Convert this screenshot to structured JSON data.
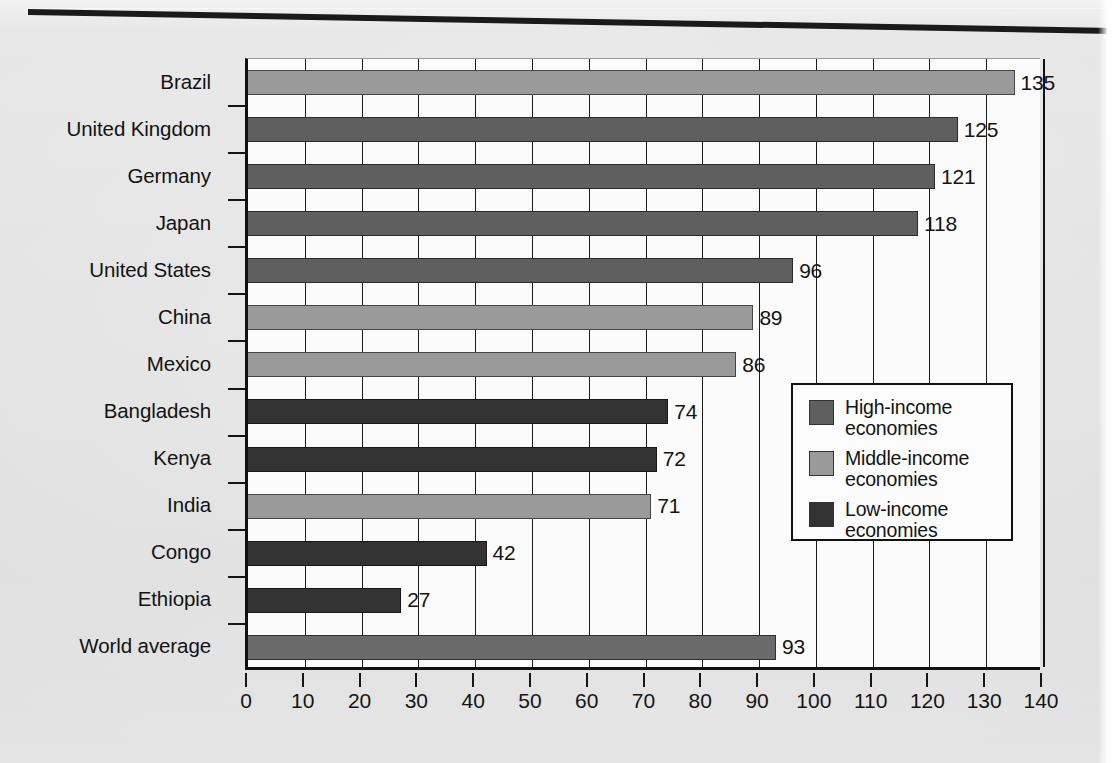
{
  "colors": {
    "high_income": "#5f5f5f",
    "middle_income": "#9a9a9a",
    "low_income": "#333333",
    "world_average": "#6a6a6a",
    "plot_background": "#fbfbfb",
    "axis": "#111111",
    "page_background": "#e1e1e1"
  },
  "legend": {
    "title": "",
    "position": "inside-right-middle",
    "items": [
      {
        "label": "High-income\neconomies",
        "color": "#5f5f5f",
        "key": "high_income"
      },
      {
        "label": "Middle-income\neconomies",
        "color": "#9a9a9a",
        "key": "middle_income"
      },
      {
        "label": "Low-income\neconomies",
        "color": "#333333",
        "key": "low_income"
      }
    ]
  },
  "chart_data": {
    "type": "bar",
    "orientation": "horizontal",
    "title": "",
    "subtitle": "",
    "xlabel": "",
    "ylabel": "",
    "xlim": [
      0,
      140
    ],
    "xticks": [
      0,
      10,
      20,
      30,
      40,
      50,
      60,
      70,
      80,
      90,
      100,
      110,
      120,
      130,
      140
    ],
    "xtick_labels": [
      "0",
      "10",
      "20",
      "30",
      "40",
      "50",
      "60",
      "70",
      "80",
      "90",
      "100",
      "110",
      "120",
      "130",
      "140"
    ],
    "grid": "vertical",
    "show_data_labels": true,
    "categories": [
      "Brazil",
      "United Kingdom",
      "Germany",
      "Japan",
      "United States",
      "China",
      "Mexico",
      "Bangladesh",
      "Kenya",
      "India",
      "Congo",
      "Ethiopia",
      "World average"
    ],
    "values": [
      135,
      125,
      121,
      118,
      96,
      89,
      86,
      74,
      72,
      71,
      42,
      27,
      93
    ],
    "value_labels": [
      "135",
      "125",
      "121",
      "118",
      "96",
      "89",
      "86",
      "74",
      "72",
      "71",
      "42",
      "27",
      "93"
    ],
    "groups": [
      "middle_income",
      "high_income",
      "high_income",
      "high_income",
      "high_income",
      "middle_income",
      "middle_income",
      "low_income",
      "low_income",
      "middle_income",
      "low_income",
      "low_income",
      "world_average"
    ],
    "bar_colors": [
      "#9a9a9a",
      "#5f5f5f",
      "#5f5f5f",
      "#5f5f5f",
      "#5f5f5f",
      "#9a9a9a",
      "#9a9a9a",
      "#333333",
      "#333333",
      "#9a9a9a",
      "#333333",
      "#333333",
      "#6a6a6a"
    ]
  }
}
